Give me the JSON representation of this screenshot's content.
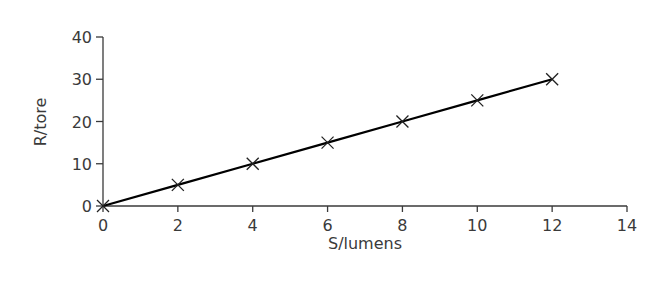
{
  "chart_data": {
    "type": "line",
    "title": "",
    "xlabel": "S/lumens",
    "ylabel": "R/tore",
    "x": [
      0,
      2,
      4,
      6,
      8,
      10,
      12
    ],
    "series": [
      {
        "name": "R vs S",
        "values": [
          0,
          5,
          10,
          15,
          20,
          25,
          30
        ],
        "marker": "x",
        "line": "solid"
      }
    ],
    "xlim": [
      0,
      14
    ],
    "ylim": [
      0,
      40
    ],
    "xticks": [
      0,
      2,
      4,
      6,
      8,
      10,
      12,
      14
    ],
    "yticks": [
      0,
      10,
      20,
      30,
      40
    ],
    "grid": false,
    "legend": "none"
  },
  "colors": {
    "line": "#000000",
    "axis": "#3a3a3a",
    "text": "#3a3a3a"
  }
}
